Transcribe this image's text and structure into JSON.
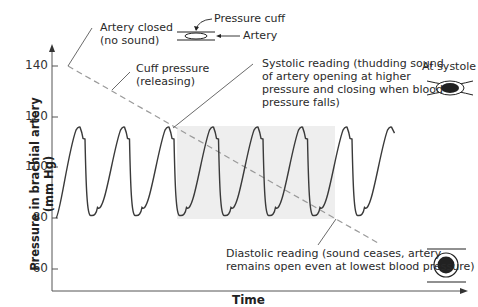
{
  "chart_data": {
    "type": "line",
    "title": "",
    "xlabel": "Time",
    "ylabel": "Pressure in brachial artery (mm Hg)",
    "yticks": [
      140,
      120,
      100,
      80,
      60
    ],
    "ylim": [
      52,
      146
    ],
    "series": [
      {
        "name": "Arterial blood pressure",
        "style": "solid",
        "cycles": 8,
        "peak_mmHg": 116,
        "trough_mmHg": 81
      },
      {
        "name": "Cuff pressure (releasing)",
        "style": "dashed",
        "start_mmHg": 140,
        "end_mmHg": 75
      }
    ],
    "shaded_region": {
      "from_cycle": 3,
      "to_cycle": 6,
      "meaning": "sound audible"
    },
    "grid": false
  },
  "axes": {
    "y_label": "Pressure in brachial artery (mm Hg)",
    "x_label": "Time",
    "ticks": [
      "140",
      "120",
      "100",
      "80",
      "60"
    ]
  },
  "annotations": {
    "artery_closed": [
      "Artery closed",
      "(no sound)"
    ],
    "cuff_pressure": [
      "Cuff pressure",
      "(releasing)"
    ],
    "systolic": [
      "Systolic reading (thudding sound",
      "of artery opening at higher",
      "pressure and closing when blood",
      "pressure falls)"
    ],
    "diastolic": [
      "Diastolic reading (sound ceases, artery",
      "remains open even at lowest blood pressure)"
    ],
    "at_systole": "At systole",
    "pressure_cuff": "Pressure cuff",
    "artery": "Artery"
  },
  "colors": {
    "line": "#3a3a3a",
    "dashed": "#9a9a9a",
    "shade": "#eeeeee",
    "axis": "#555555"
  }
}
